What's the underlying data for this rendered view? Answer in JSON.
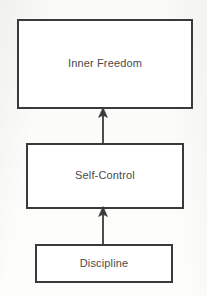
{
  "diagram": {
    "type": "flowchart",
    "orientation": "bottom-to-top",
    "background_color": "#fdfdfc",
    "stroke_color": "#3a3a3a",
    "text_color": "#4a4a4a",
    "nodes": [
      {
        "id": "inner-freedom",
        "label": "Inner Freedom",
        "shape": "rectangle",
        "level": 3
      },
      {
        "id": "self-control",
        "label": "Self-Control",
        "shape": "rectangle",
        "level": 2
      },
      {
        "id": "discipline",
        "label": "Discipline",
        "shape": "rectangle",
        "level": 1
      }
    ],
    "connectors": [
      {
        "id": "self-control-to-inner-freedom",
        "from": "self-control",
        "to": "inner-freedom",
        "direction": "up",
        "arrowhead": "filled-triangle",
        "label": ""
      },
      {
        "id": "discipline-to-self-control",
        "from": "discipline",
        "to": "self-control",
        "direction": "up",
        "arrowhead": "filled-triangle",
        "label": ""
      }
    ]
  }
}
